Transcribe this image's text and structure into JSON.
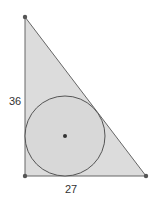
{
  "diagram": {
    "type": "right-triangle-with-incircle",
    "labels": {
      "vertical_leg": "36",
      "horizontal_leg": "27"
    },
    "colors": {
      "fill": "#dcdcdc",
      "stroke": "#555555",
      "point": "#444444"
    }
  }
}
